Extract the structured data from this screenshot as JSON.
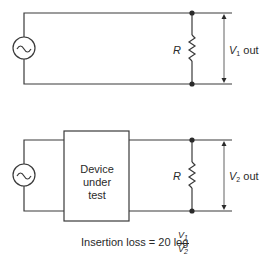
{
  "circuit1": {
    "resistor_label": "R",
    "output_label_var": "V",
    "output_label_sub": "1",
    "output_label_suffix": " out"
  },
  "circuit2": {
    "device_label_lines": [
      "Device",
      "under",
      "test"
    ],
    "resistor_label": "R",
    "output_label_var": "V",
    "output_label_sub": "2",
    "output_label_suffix": " out"
  },
  "formula": {
    "text": "Insertion loss = 20 log",
    "numerator_var": "V",
    "numerator_sub": "1",
    "denominator_var": "V",
    "denominator_sub": "2"
  },
  "colors": {
    "line": "#3a3a3a",
    "text": "#2a2a2a",
    "background": "#ffffff"
  }
}
